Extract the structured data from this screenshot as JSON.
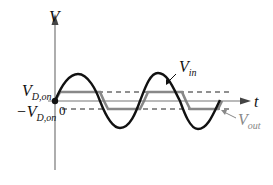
{
  "diagram": {
    "y_axis_label": "V",
    "x_axis_label": "t",
    "vin_label": "V",
    "vin_sub": "in",
    "vout_label": "V",
    "vout_sub": "out",
    "vdon_label": "V",
    "vdon_sub": "D,on",
    "neg_vdon_prefix": "−V",
    "neg_vdon_sub": "D,on",
    "zero_label": "0",
    "colors": {
      "axis": "#777777",
      "vin": "#111111",
      "vout": "#888888",
      "dashed": "#222222",
      "vout_label": "#888888"
    }
  }
}
